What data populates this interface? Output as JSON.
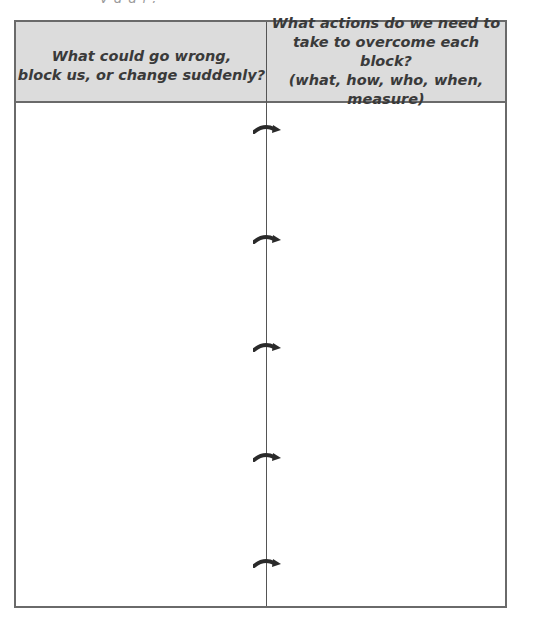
{
  "document": {
    "table": {
      "columns": [
        {
          "header_lines": [
            "What could go wrong,",
            "block us, or change suddenly?"
          ],
          "value": ""
        },
        {
          "header_lines": [
            "What actions do we need to",
            "take to overcome each block?",
            "(what, how, who, when, measure)"
          ],
          "value": ""
        }
      ],
      "arrows": [
        {
          "icon": "curved-right-arrow-icon",
          "y": 107
        },
        {
          "icon": "curved-right-arrow-icon",
          "y": 217
        },
        {
          "icon": "curved-right-arrow-icon",
          "y": 325
        },
        {
          "icon": "curved-right-arrow-icon",
          "y": 435
        },
        {
          "icon": "curved-right-arrow-icon",
          "y": 541
        }
      ]
    },
    "colors": {
      "header_bg": "#dcdcdc",
      "border": "#6a6a6a",
      "header_text": "#3a3a3a",
      "arrow": "#2a2a2a"
    }
  }
}
